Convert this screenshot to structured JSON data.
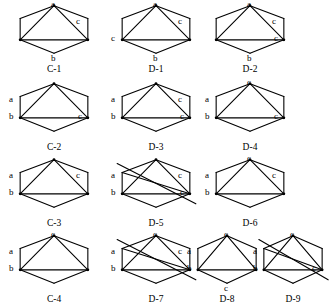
{
  "figure": {
    "title": "",
    "background_color": "#ffffff",
    "stroke_color": "#000000",
    "text_color": "#000000",
    "rows": 4,
    "shape": "hexagon-graph"
  },
  "diagrams": [
    {
      "caption": "C-1",
      "x": 18,
      "y": 4,
      "w": 72,
      "h": 56,
      "vertex_labels": [
        {
          "key": "top",
          "text": "a",
          "dx": 33,
          "dy": -4
        },
        {
          "key": "upper_right",
          "text": "c",
          "dx": 58,
          "dy": 13
        },
        {
          "key": "bottom",
          "text": "b",
          "dx": 33,
          "dy": 50
        }
      ],
      "internal_edges": [
        "top-midleft",
        "top-midright",
        "midleft-midright"
      ],
      "crossed_out": false
    },
    {
      "caption": "D-1",
      "x": 120,
      "y": 4,
      "w": 72,
      "h": 56,
      "vertex_labels": [
        {
          "key": "top",
          "text": "a",
          "dx": 33,
          "dy": -4
        },
        {
          "key": "upper_right",
          "text": "c",
          "dx": 58,
          "dy": 13
        },
        {
          "key": "mid_left",
          "text": "c",
          "dx": -9,
          "dy": 30
        },
        {
          "key": "bottom",
          "text": "b",
          "dx": 33,
          "dy": 50
        }
      ],
      "internal_edges": [
        "top-midleft",
        "top-midright",
        "midleft-midright"
      ],
      "crossed_out": false
    },
    {
      "caption": "D-2",
      "x": 214,
      "y": 4,
      "w": 72,
      "h": 56,
      "vertex_labels": [
        {
          "key": "top",
          "text": "a",
          "dx": 33,
          "dy": -4
        },
        {
          "key": "upper_right",
          "text": "c",
          "dx": 58,
          "dy": 13
        },
        {
          "key": "mid_right",
          "text": "c",
          "dx": 60,
          "dy": 30
        },
        {
          "key": "bottom",
          "text": "b",
          "dx": 33,
          "dy": 50
        }
      ],
      "internal_edges": [
        "top-midleft",
        "top-midright",
        "midleft-midright"
      ],
      "crossed_out": false
    },
    {
      "caption": "C-2",
      "x": 18,
      "y": 82,
      "w": 72,
      "h": 56,
      "vertex_labels": [
        {
          "key": "upper_left",
          "text": "a",
          "dx": -9,
          "dy": 13
        },
        {
          "key": "mid_left",
          "text": "b",
          "dx": -9,
          "dy": 30
        },
        {
          "key": "mid_right",
          "text": "c",
          "dx": 60,
          "dy": 30
        }
      ],
      "internal_edges": [
        "top-midleft",
        "top-midright",
        "midleft-midright"
      ],
      "crossed_out": false
    },
    {
      "caption": "D-3",
      "x": 120,
      "y": 82,
      "w": 72,
      "h": 56,
      "vertex_labels": [
        {
          "key": "upper_left",
          "text": "a",
          "dx": -9,
          "dy": 13
        },
        {
          "key": "upper_right",
          "text": "c",
          "dx": 58,
          "dy": 13
        },
        {
          "key": "mid_left",
          "text": "b",
          "dx": -9,
          "dy": 30
        },
        {
          "key": "mid_right",
          "text": "c",
          "dx": 60,
          "dy": 30
        }
      ],
      "internal_edges": [
        "top-midleft",
        "top-midright",
        "midleft-midright"
      ],
      "crossed_out": false
    },
    {
      "caption": "D-4",
      "x": 214,
      "y": 82,
      "w": 72,
      "h": 56,
      "vertex_labels": [
        {
          "key": "top",
          "text": "c",
          "dx": 33,
          "dy": -4
        },
        {
          "key": "upper_left",
          "text": "a",
          "dx": -9,
          "dy": 13
        },
        {
          "key": "mid_left",
          "text": "b",
          "dx": -9,
          "dy": 30
        },
        {
          "key": "mid_right",
          "text": "c",
          "dx": 60,
          "dy": 30
        }
      ],
      "internal_edges": [
        "top-midleft",
        "top-midright",
        "midleft-midright"
      ],
      "crossed_out": false
    },
    {
      "caption": "C-3",
      "x": 18,
      "y": 158,
      "w": 72,
      "h": 56,
      "vertex_labels": [
        {
          "key": "upper_left",
          "text": "a",
          "dx": -9,
          "dy": 13
        },
        {
          "key": "upper_right",
          "text": "c",
          "dx": 58,
          "dy": 13
        },
        {
          "key": "mid_left",
          "text": "b",
          "dx": -9,
          "dy": 30
        }
      ],
      "internal_edges": [
        "top-midleft",
        "top-midright",
        "midleft-midright"
      ],
      "crossed_out": false
    },
    {
      "caption": "D-5",
      "x": 120,
      "y": 158,
      "w": 72,
      "h": 56,
      "vertex_labels": [
        {
          "key": "upper_left",
          "text": "a",
          "dx": -9,
          "dy": 13
        },
        {
          "key": "upper_right",
          "text": "c",
          "dx": 58,
          "dy": 13
        },
        {
          "key": "mid_left",
          "text": "b",
          "dx": -9,
          "dy": 30
        },
        {
          "key": "mid_right",
          "text": "c",
          "dx": 60,
          "dy": 30
        }
      ],
      "internal_edges": [
        "top-midleft",
        "top-midright",
        "midleft-midright",
        "upperleft-midright",
        "top-bottom-diag"
      ],
      "crossed_out": true
    },
    {
      "caption": "D-6",
      "x": 214,
      "y": 158,
      "w": 72,
      "h": 56,
      "vertex_labels": [
        {
          "key": "top",
          "text": "c",
          "dx": 33,
          "dy": -4
        },
        {
          "key": "upper_left",
          "text": "a",
          "dx": -9,
          "dy": 13
        },
        {
          "key": "upper_right",
          "text": "c",
          "dx": 58,
          "dy": 13
        },
        {
          "key": "mid_left",
          "text": "b",
          "dx": -9,
          "dy": 30
        }
      ],
      "internal_edges": [
        "top-midleft",
        "top-midright",
        "midleft-midright"
      ],
      "crossed_out": false
    },
    {
      "caption": "C-4",
      "x": 18,
      "y": 234,
      "w": 72,
      "h": 56,
      "vertex_labels": [
        {
          "key": "top",
          "text": "c",
          "dx": 33,
          "dy": -4
        },
        {
          "key": "upper_left",
          "text": "a",
          "dx": -9,
          "dy": 13
        },
        {
          "key": "mid_left",
          "text": "b",
          "dx": -9,
          "dy": 30
        }
      ],
      "internal_edges": [
        "top-midleft",
        "top-midright",
        "midleft-midright"
      ],
      "crossed_out": false
    },
    {
      "caption": "D-7",
      "x": 120,
      "y": 234,
      "w": 72,
      "h": 56,
      "vertex_labels": [
        {
          "key": "top",
          "text": "c",
          "dx": 33,
          "dy": -4
        },
        {
          "key": "upper_left",
          "text": "a",
          "dx": -9,
          "dy": 13
        },
        {
          "key": "upper_right",
          "text": "c",
          "dx": 58,
          "dy": 13
        },
        {
          "key": "mid_left",
          "text": "b",
          "dx": -9,
          "dy": 30
        }
      ],
      "internal_edges": [
        "top-midleft",
        "top-midright",
        "midleft-midright",
        "upperleft-midright",
        "top-bottom-diag"
      ],
      "crossed_out": true
    },
    {
      "caption": "D-8",
      "x": 196,
      "y": 234,
      "w": 62,
      "h": 56,
      "vertex_labels": [
        {
          "key": "top",
          "text": "c",
          "dx": 28,
          "dy": -4
        },
        {
          "key": "upper_left",
          "text": "a",
          "dx": -9,
          "dy": 13
        },
        {
          "key": "mid_left",
          "text": "b",
          "dx": -9,
          "dy": 30
        },
        {
          "key": "bottom",
          "text": "c",
          "dx": 28,
          "dy": 50
        }
      ],
      "internal_edges": [
        "top-midleft",
        "top-midright",
        "midleft-midright"
      ],
      "crossed_out": false
    },
    {
      "caption": "D-9",
      "x": 262,
      "y": 234,
      "w": 62,
      "h": 56,
      "vertex_labels": [
        {
          "key": "top",
          "text": "c",
          "dx": 28,
          "dy": -4
        },
        {
          "key": "upper_left",
          "text": "a",
          "dx": -9,
          "dy": 13
        },
        {
          "key": "mid_left",
          "text": "b",
          "dx": -9,
          "dy": 30
        },
        {
          "key": "mid_right",
          "text": "c",
          "dx": 50,
          "dy": 30
        }
      ],
      "internal_edges": [
        "top-midleft",
        "top-midright",
        "midleft-midright",
        "upperleft-midright",
        "top-bottom-diag"
      ],
      "crossed_out": true
    }
  ]
}
